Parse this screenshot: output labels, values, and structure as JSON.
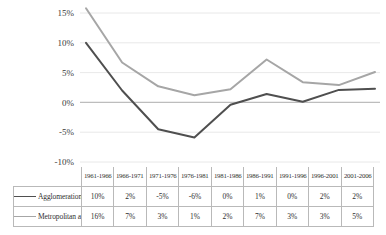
{
  "chart_data": {
    "type": "line",
    "title": "",
    "xlabel": "",
    "ylabel": "",
    "ylim": [
      -10,
      15
    ],
    "ytick_values": [
      15,
      10,
      5,
      0,
      -5,
      -10
    ],
    "ytick_labels": [
      "15%",
      "10%",
      "5%",
      "0%",
      "-5%",
      "-10%"
    ],
    "grid": true,
    "legend_position": "table-left",
    "categories": [
      "1961-1966",
      "1966-1971",
      "1971-1976",
      "1976-1981",
      "1981-1986",
      "1986-1991",
      "1991-1996",
      "1996-2001",
      "2001-2006"
    ],
    "series": [
      {
        "name": "Agglomeration",
        "color": "#4f4f4f",
        "values": [
          10,
          2,
          -5,
          -6,
          0,
          1,
          0,
          2,
          2
        ],
        "plotted_values": [
          10.0,
          2.0,
          -4.5,
          -5.9,
          -0.4,
          1.4,
          0.1,
          2.1,
          2.3
        ],
        "labels": [
          "10%",
          "2%",
          "-5%",
          "-6%",
          "0%",
          "1%",
          "0%",
          "2%",
          "2%"
        ]
      },
      {
        "name": "Metropolitan area",
        "color": "#a6a6a6",
        "values": [
          16,
          7,
          3,
          1,
          2,
          7,
          3,
          3,
          5
        ],
        "plotted_values": [
          15.8,
          6.7,
          2.7,
          1.2,
          2.2,
          7.2,
          3.4,
          2.9,
          5.1
        ],
        "labels": [
          "16%",
          "7%",
          "3%",
          "1%",
          "2%",
          "7%",
          "3%",
          "3%",
          "5%"
        ]
      }
    ]
  }
}
